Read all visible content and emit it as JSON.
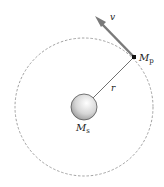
{
  "diagram": {
    "labels": {
      "velocity": "v",
      "planet_mass": "M",
      "planet_subscript": "p",
      "radius": "r",
      "star_mass": "M",
      "star_subscript": "s"
    },
    "colors": {
      "orbit": "#8a8a8a",
      "arrow": "#7a7a7a",
      "radius_line": "#333333",
      "planet": "#111111",
      "star_fill": "#d8d8d8",
      "star_stroke": "#555555"
    }
  }
}
